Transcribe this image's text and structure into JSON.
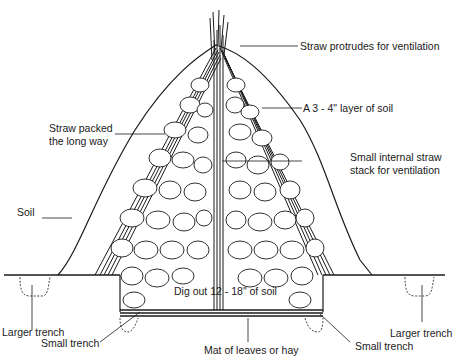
{
  "diagram": {
    "labels": {
      "straw_protrudes": "Straw protrudes for ventilation",
      "soil_layer": "A 3 - 4\" layer of soil",
      "straw_packed_line1": "Straw packed",
      "straw_packed_line2": "the long way",
      "internal_stack_line1": "Small internal straw",
      "internal_stack_line2": "stack for ventilation",
      "soil": "Soil",
      "dig_out": "Dig out 12 - 18\" of soil",
      "larger_trench_left": "Larger trench",
      "small_trench_left": "Small trench",
      "mat": "Mat of leaves or hay",
      "small_trench_right": "Small trench",
      "larger_trench_right": "Larger trench"
    },
    "colors": {
      "ink": "#1a1a1a",
      "background": "#ffffff",
      "tuber_fill": "#ffffff"
    }
  }
}
